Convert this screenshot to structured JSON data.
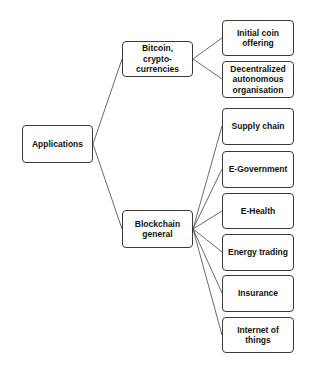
{
  "diagram": {
    "type": "tree",
    "root": {
      "id": "applications",
      "label": "Applications"
    },
    "branches": [
      {
        "id": "bitcoin",
        "label": "Bitcoin,\ncrypto-\ncurrencies",
        "children": [
          {
            "id": "ico",
            "label": "Initial coin\noffering"
          },
          {
            "id": "dao",
            "label": "Decentralized\nautonomous\norganisation"
          }
        ]
      },
      {
        "id": "blockchain",
        "label": "Blockchain\ngeneral",
        "children": [
          {
            "id": "supply",
            "label": "Supply chain"
          },
          {
            "id": "egov",
            "label": "E-Government"
          },
          {
            "id": "ehealth",
            "label": "E-Health"
          },
          {
            "id": "energy",
            "label": "Energy trading"
          },
          {
            "id": "insurance",
            "label": "Insurance"
          },
          {
            "id": "iot",
            "label": "Internet of\nthings"
          }
        ]
      }
    ],
    "colors": {
      "border": "#3a3a3a",
      "text": "#111111",
      "background": "#ffffff"
    }
  }
}
